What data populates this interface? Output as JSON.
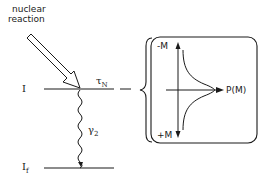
{
  "diagram": {
    "source_label": [
      "nuclear",
      "reaction"
    ],
    "levels": {
      "initial": "I",
      "final": "I",
      "final_subscript": "f"
    },
    "lifetime": {
      "symbol": "τ",
      "subscript": "N"
    },
    "gamma": {
      "symbol": "γ",
      "subscript": "2"
    },
    "distribution_box": {
      "top_label": "-M",
      "bottom_label": "+M",
      "axis_label": "P(M)"
    },
    "colors": {
      "ink": "#1a1a1a",
      "background": "#ffffff"
    }
  }
}
